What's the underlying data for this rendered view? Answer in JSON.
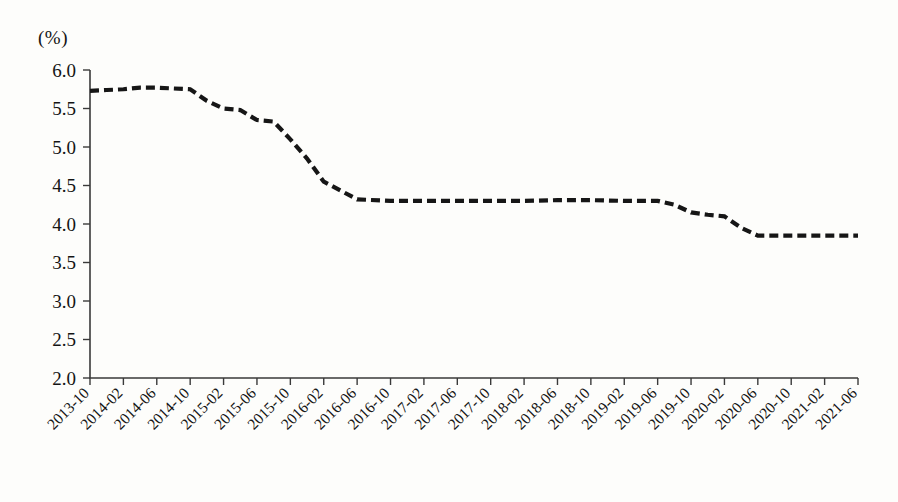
{
  "chart_data": {
    "type": "line",
    "title": "",
    "subtitle": "",
    "xlabel": "",
    "ylabel": "",
    "unit_label": "(%)",
    "ylim": [
      2.0,
      6.0
    ],
    "y_ticks": [
      "2.0",
      "2.5",
      "3.0",
      "3.5",
      "4.0",
      "4.5",
      "5.0",
      "5.5",
      "6.0"
    ],
    "y_tick_values": [
      2.0,
      2.5,
      3.0,
      3.5,
      4.0,
      4.5,
      5.0,
      5.5,
      6.0
    ],
    "grid": false,
    "legend": "none",
    "line_style": "dashed",
    "line_color": "#161616",
    "categories": [
      "2013-10",
      "2014-02",
      "2014-06",
      "2014-10",
      "2015-02",
      "2015-06",
      "2015-10",
      "2016-02",
      "2016-06",
      "2016-10",
      "2017-02",
      "2017-06",
      "2017-10",
      "2018-02",
      "2018-06",
      "2018-10",
      "2019-02",
      "2019-06",
      "2019-10",
      "2020-02",
      "2020-06",
      "2020-10",
      "2021-02",
      "2021-06"
    ],
    "x_tick_interval_months": 4,
    "series": [
      {
        "name": "rate",
        "x": [
          "2013-10",
          "2013-12",
          "2014-02",
          "2014-04",
          "2014-06",
          "2014-08",
          "2014-10",
          "2014-12",
          "2015-02",
          "2015-04",
          "2015-06",
          "2015-08",
          "2015-10",
          "2015-12",
          "2016-02",
          "2016-06",
          "2016-10",
          "2017-02",
          "2017-06",
          "2017-10",
          "2018-02",
          "2018-06",
          "2018-10",
          "2019-02",
          "2019-06",
          "2019-08",
          "2019-10",
          "2019-12",
          "2020-02",
          "2020-04",
          "2020-06",
          "2020-10",
          "2021-02",
          "2021-06"
        ],
        "values": [
          5.73,
          5.74,
          5.75,
          5.77,
          5.77,
          5.76,
          5.75,
          5.6,
          5.5,
          5.48,
          5.35,
          5.33,
          5.1,
          4.85,
          4.55,
          4.32,
          4.3,
          4.3,
          4.3,
          4.3,
          4.3,
          4.31,
          4.31,
          4.3,
          4.3,
          4.25,
          4.15,
          4.12,
          4.1,
          3.95,
          3.85,
          3.85,
          3.85,
          3.85
        ]
      }
    ],
    "annotations": []
  }
}
